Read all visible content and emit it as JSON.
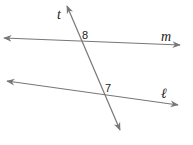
{
  "diagram": {
    "type": "parallel lines cut by a transversal",
    "stroke_color": "#777777",
    "lines": [
      {
        "id": "t",
        "label": "t",
        "from": [
          67,
          6
        ],
        "to": [
          120,
          130
        ]
      },
      {
        "id": "m",
        "label": "m",
        "from": [
          4,
          38
        ],
        "to": [
          180,
          45
        ]
      },
      {
        "id": "l",
        "label": "ℓ",
        "from": [
          7,
          81
        ],
        "to": [
          178,
          105
        ]
      }
    ],
    "angles": [
      {
        "label": "8",
        "at": "intersection of t and m"
      },
      {
        "label": "7",
        "at": "intersection of t and ℓ"
      }
    ]
  }
}
